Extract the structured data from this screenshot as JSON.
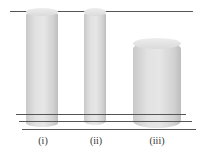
{
  "diagram": {
    "cylinders": [
      {
        "label": "(i)"
      },
      {
        "label": "(ii)"
      },
      {
        "label": "(iii)"
      }
    ]
  }
}
